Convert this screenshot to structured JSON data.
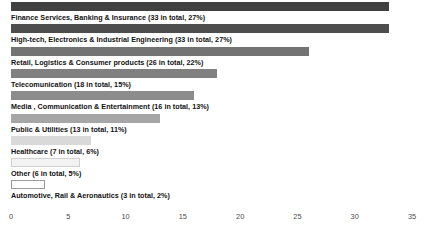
{
  "chart_data": {
    "type": "bar",
    "orientation": "horizontal",
    "title": "",
    "subtitle": "",
    "xlabel": "",
    "ylabel": "",
    "xlim": [
      0,
      35
    ],
    "grid": false,
    "legend": null,
    "xticks": [
      0,
      5,
      10,
      15,
      20,
      25,
      30,
      35
    ],
    "xtick_labels": [
      "0",
      "5",
      "10",
      "15",
      "20",
      "25",
      "30",
      "35"
    ],
    "categories": [
      "Finance Services, Banking & Insurance",
      "High-tech, Electronics & Industrial Engineering",
      "Retail, Logistics & Consumer products",
      "Telecomunication",
      "Media , Communication & Entertainment",
      "Public & Utilities",
      "Healthcare",
      "Other",
      "Automotive, Rail & Aeronautics"
    ],
    "values": [
      33,
      33,
      26,
      18,
      16,
      13,
      7,
      6,
      3
    ],
    "percentages": [
      "27%",
      "27%",
      "22%",
      "15%",
      "13%",
      "11%",
      "6%",
      "5%",
      "2%"
    ],
    "bar_colors": [
      "#404040",
      "#4d4d4d",
      "#737373",
      "#808080",
      "#8c8c8c",
      "#a6a6a6",
      "#d9d9d9",
      "#f2f2f2",
      "#ffffff"
    ],
    "bar_border_colors": [
      "#404040",
      "#4d4d4d",
      "#737373",
      "#808080",
      "#8c8c8c",
      "#a6a6a6",
      "#d9d9d9",
      "#d0d0d0",
      "#9a9a9a"
    ],
    "bars": [
      {
        "label": "Finance Services, Banking & Insurance (33 in total, 27%)",
        "value": 33,
        "name": "Finance Services, Banking & Insurance",
        "count": 33,
        "percent": "27%"
      },
      {
        "label": "High-tech, Electronics & Industrial Engineering (33 in total, 27%)",
        "value": 33,
        "name": "High-tech, Electronics & Industrial Engineering",
        "count": 33,
        "percent": "27%"
      },
      {
        "label": "Retail, Logistics & Consumer products (26 in total, 22%)",
        "value": 26,
        "name": "Retail, Logistics & Consumer products",
        "count": 26,
        "percent": "22%"
      },
      {
        "label": "Telecomunication (18 in total, 15%)",
        "value": 18,
        "name": "Telecomunication",
        "count": 18,
        "percent": "15%"
      },
      {
        "label": "Media , Communication & Entertainment (16 in total, 13%)",
        "value": 16,
        "name": "Media , Communication & Entertainment",
        "count": 16,
        "percent": "13%"
      },
      {
        "label": "Public & Utilities (13 in total, 11%)",
        "value": 13,
        "name": "Public & Utilities",
        "count": 13,
        "percent": "11%"
      },
      {
        "label": "Healthcare (7 in total, 6%)",
        "value": 7,
        "name": "Healthcare",
        "count": 7,
        "percent": "6%"
      },
      {
        "label": "Other (6 in total, 5%)",
        "value": 6,
        "name": "Other",
        "count": 6,
        "percent": "5%"
      },
      {
        "label": "Automotive, Rail & Aeronautics (3 in total, 2%)",
        "value": 3,
        "name": "Automotive, Rail & Aeronautics",
        "count": 3,
        "percent": "2%"
      }
    ]
  }
}
